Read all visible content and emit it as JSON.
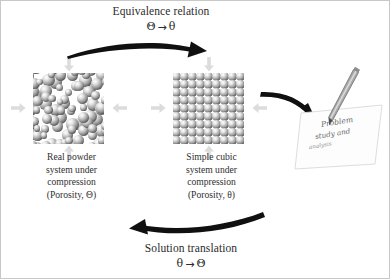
{
  "figure": {
    "type": "cycle-diagram",
    "background_color": "#ffffff",
    "border_color": "#c8c8c8",
    "ink_color": "#2b2b2b",
    "compression_arrow_color": "#dcdcdc"
  },
  "top_relation": {
    "label": "Equivalence relation",
    "from_symbol": "Θ",
    "arrow": "→",
    "to_symbol": "θ",
    "direction": "left-to-right"
  },
  "bottom_relation": {
    "label": "Solution translation",
    "from_symbol": "θ",
    "arrow": "→",
    "to_symbol": "Θ",
    "direction": "right-to-left"
  },
  "left_system": {
    "name": "real-powder-system",
    "caption_lines": [
      "Real powder",
      "system under",
      "compression",
      "(Porosity, Θ)"
    ],
    "packing": "random",
    "porosity_symbol": "Θ"
  },
  "center_system": {
    "name": "simple-cubic-system",
    "caption_lines": [
      "Simple cubic",
      "system under",
      "compression",
      "(Porosity, θ)"
    ],
    "packing": "simple-cubic",
    "grid_columns": 9,
    "grid_rows": 9,
    "porosity_symbol": "θ"
  },
  "analysis": {
    "name": "problem-analysis-note",
    "handwriting_lines": [
      "Problem",
      "study and",
      "analysis"
    ]
  },
  "compression_arrows": {
    "directions": [
      "top",
      "right",
      "bottom",
      "left"
    ],
    "count_per_block": 4
  }
}
